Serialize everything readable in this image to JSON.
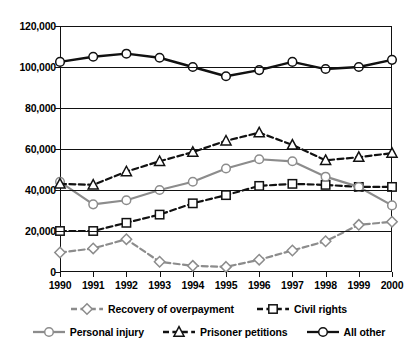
{
  "chart_data": {
    "type": "line",
    "title": "",
    "subtitle": "",
    "xlabel": "",
    "ylabel": "",
    "grid": true,
    "legend_position": "bottom",
    "categories": [
      "1990",
      "1991",
      "1992",
      "1993",
      "1994",
      "1995",
      "1996",
      "1997",
      "1998",
      "1999",
      "2000"
    ],
    "x": [
      1990,
      1991,
      1992,
      1993,
      1994,
      1995,
      1996,
      1997,
      1998,
      1999,
      2000
    ],
    "xlim": [
      1990,
      2000
    ],
    "ylim": [
      0,
      120000
    ],
    "ytick_values": [
      0,
      20000,
      40000,
      60000,
      80000,
      100000,
      120000
    ],
    "ytick_labels": [
      "0",
      "20,000",
      "40,000",
      "60,000",
      "80,000",
      "100,000",
      "120,000"
    ],
    "series": [
      {
        "name": "Recovery of overpayment",
        "color": "#8c8c8c",
        "marker": "diamond",
        "linestyle": "dashed",
        "values": [
          9500,
          11500,
          16000,
          5000,
          3000,
          2500,
          6000,
          10500,
          15000,
          23000,
          24500
        ]
      },
      {
        "name": "Civil rights",
        "color": "#111111",
        "marker": "square",
        "linestyle": "dashed",
        "values": [
          20000,
          20000,
          24000,
          28000,
          33500,
          37500,
          42000,
          43000,
          42500,
          41500,
          41500
        ]
      },
      {
        "name": "Personal injury",
        "color": "#8c8c8c",
        "marker": "circle",
        "linestyle": "solid",
        "values": [
          44000,
          33000,
          35000,
          40000,
          44000,
          50500,
          55000,
          54000,
          46500,
          41500,
          32500
        ]
      },
      {
        "name": "Prisoner petitions",
        "color": "#111111",
        "marker": "triangle",
        "linestyle": "dashed",
        "values": [
          43000,
          42500,
          49000,
          54000,
          58500,
          64000,
          68000,
          62000,
          54500,
          56000,
          58000
        ]
      },
      {
        "name": "All other",
        "color": "#111111",
        "marker": "circle",
        "linestyle": "solid",
        "values": [
          102500,
          105000,
          106500,
          104500,
          100000,
          95500,
          98500,
          102500,
          99000,
          100000,
          103500
        ]
      }
    ]
  },
  "legend": {
    "rows": [
      [
        "Recovery of overpayment",
        "Civil rights"
      ],
      [
        "Personal injury",
        "Prisoner petitions",
        "All other"
      ]
    ]
  }
}
